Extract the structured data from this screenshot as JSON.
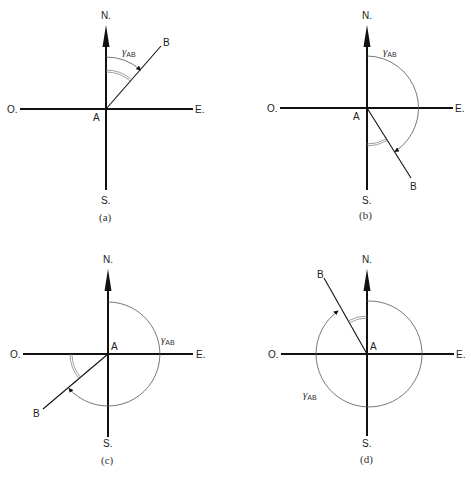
{
  "figure": {
    "axis_labels": {
      "north": "N.",
      "south": "S.",
      "east": "E.",
      "west": "O."
    },
    "origin_label": "A",
    "target_label": "B",
    "angle_symbol": "γ",
    "angle_subscript": "AB",
    "panels": [
      {
        "id": "a",
        "caption": "(a)",
        "quadrant": "NE",
        "approx_bearing_deg": 35
      },
      {
        "id": "b",
        "caption": "(b)",
        "quadrant": "SE",
        "approx_bearing_deg": 148
      },
      {
        "id": "c",
        "caption": "(c)",
        "quadrant": "SW",
        "approx_bearing_deg": 230
      },
      {
        "id": "d",
        "caption": "(d)",
        "quadrant": "NW",
        "approx_bearing_deg": 330
      }
    ]
  },
  "colors": {
    "line": "#111111",
    "arc": "#555555",
    "background": "#ffffff"
  }
}
